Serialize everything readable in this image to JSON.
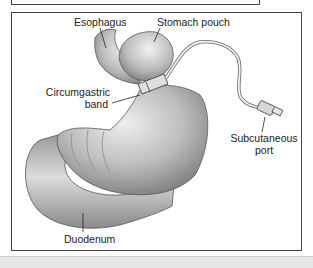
{
  "figure": {
    "labels": {
      "esophagus": "Esophagus",
      "stomach_pouch": "Stomach pouch",
      "band_line1": "Circumgastric",
      "band_line2": "band",
      "port_line1": "Subcutaneous",
      "port_line2": "port",
      "duodenum": "Duodenum"
    },
    "colors": {
      "border": "#444444",
      "organ_fill": "#b8b8b8",
      "organ_shadow": "#7a7a7a",
      "highlight": "#e8e8e8",
      "band_bg": "#e6e6e6"
    }
  }
}
